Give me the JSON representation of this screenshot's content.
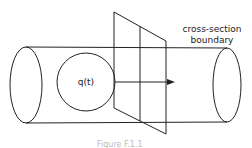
{
  "diagram": {
    "labels": {
      "flow": "q(t)",
      "boundary_line1": "cross-section",
      "boundary_line2": "boundary"
    },
    "caption": "Figure F.1.1",
    "colors": {
      "stroke": "#222222",
      "background": "#ffffff"
    }
  }
}
